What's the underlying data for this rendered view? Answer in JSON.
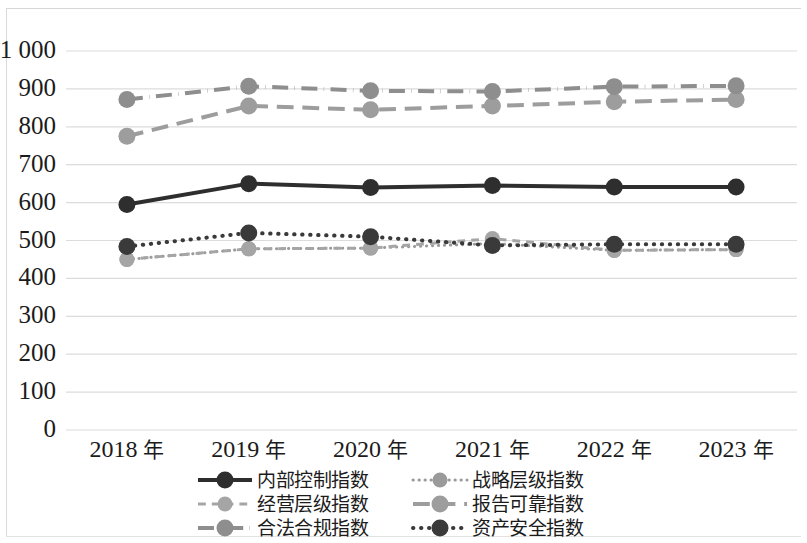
{
  "chart_data": {
    "type": "line",
    "title": "",
    "xlabel": "",
    "ylabel": "",
    "categories": [
      "2018 年",
      "2019 年",
      "2020 年",
      "2021 年",
      "2022 年",
      "2023 年"
    ],
    "ylim": [
      0,
      1000
    ],
    "ytick_labels": [
      "1 000",
      "900",
      "800",
      "700",
      "600",
      "500",
      "400",
      "300",
      "200",
      "100",
      "0"
    ],
    "ytick_values": [
      1000,
      900,
      800,
      700,
      600,
      500,
      400,
      300,
      200,
      100,
      0
    ],
    "grid": "horizontal",
    "legend_position": "bottom",
    "series": [
      {
        "name": "内部控制指数",
        "values": [
          595,
          650,
          640,
          645,
          641,
          641
        ],
        "color": "#2e2e2e",
        "dash": "solid",
        "width": 4
      },
      {
        "name": "战略层级指数",
        "values": [
          450,
          478,
          480,
          492,
          474,
          476
        ],
        "color": "#9a9a9a",
        "dash": "dotted",
        "width": 3
      },
      {
        "name": "经营层级指数",
        "values": [
          450,
          478,
          480,
          505,
          474,
          476
        ],
        "color": "#a5a5a5",
        "dash": "dashed",
        "width": 3
      },
      {
        "name": "报告可靠指数",
        "values": [
          775,
          855,
          845,
          855,
          866,
          872
        ],
        "color": "#9d9d9d",
        "dash": "longdash",
        "width": 4
      },
      {
        "name": "合法合规指数",
        "values": [
          872,
          907,
          895,
          893,
          906,
          908
        ],
        "color": "#8e8e8e",
        "dash": "dashdot",
        "width": 4
      },
      {
        "name": "资产安全指数",
        "values": [
          484,
          520,
          510,
          487,
          490,
          490
        ],
        "color": "#3a3a3a",
        "dash": "dotted",
        "width": 4
      }
    ]
  }
}
